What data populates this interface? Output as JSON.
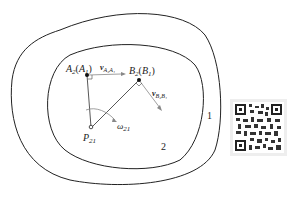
{
  "diagram": {
    "regions": {
      "outer_label": "1",
      "inner_label": "2"
    },
    "points": {
      "A": {
        "label": "A",
        "sub": "2",
        "paren_label": "A",
        "paren_sub": "1"
      },
      "B": {
        "label": "B",
        "sub": "2",
        "paren_label": "B",
        "paren_sub": "1"
      },
      "P": {
        "label": "P",
        "sub": "21"
      }
    },
    "vectors": {
      "vA": {
        "label": "v",
        "sub": "A₂A₁"
      },
      "vB": {
        "label": "v",
        "sub": "B₂B₁"
      }
    },
    "rotation": {
      "label": "ω",
      "sub": "21"
    },
    "colors": {
      "stroke": "#222222",
      "vector": "#888888",
      "qr_bg": "#eeeeee"
    },
    "qr_code": "qr-code-image"
  }
}
